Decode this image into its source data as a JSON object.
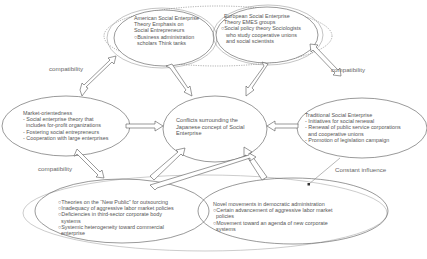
{
  "colors": {
    "stroke": "#555555",
    "outer_stroke": "#aaaaaa",
    "text": "#555555",
    "background": "#ffffff"
  },
  "nodes": {
    "american": {
      "lines": [
        "American Social Enterprise",
        "Theory Emphasis on",
        "Social Entrepreneurs",
        "○Business administration",
        "  scholars Think tanks"
      ]
    },
    "european": {
      "lines": [
        "European Social Enterprise",
        "Theory EMES groups",
        "○Social policy theory Sociologists",
        "who study cooperative unions",
        "and social scientists"
      ]
    },
    "market": {
      "lines": [
        "Market-orientedness",
        "- Social enterprise theory that",
        "  includes for-profit organizations",
        "- Fostering social entrepreneurs",
        "- Cooperation with large enterprises"
      ]
    },
    "center": {
      "lines": [
        "Conflicts surrounding the",
        "Japanese concept of Social",
        "Enterprise"
      ]
    },
    "traditional": {
      "lines": [
        "Traditional Social Enterprise",
        "- Initiatives for social renewal",
        "- Renewal of public service corporations",
        "  and cooperative unions",
        "- Promotion of legislation campaign"
      ]
    },
    "new_public": {
      "lines": [
        "○Theories on the “New Public” for outsourcing",
        "○Inadequacy of aggressive labor market policies",
        "○Deficiencies in third-sector corporate body",
        "  systems",
        "○Systemic heterogeneity toward commercial",
        "  enterprise"
      ]
    },
    "novel": {
      "lines": [
        "Novel movements in democratic administration",
        "○Certain advancement of aggressive labor market",
        "  policies",
        "○Movement toward an agenda of new corporate",
        "  systems"
      ]
    }
  },
  "labels": {
    "compat_top_left": "compatibility",
    "compat_top_right": "compatibility",
    "compat_bottom_left": "compatibility",
    "constant_influence": "Constant influence"
  }
}
